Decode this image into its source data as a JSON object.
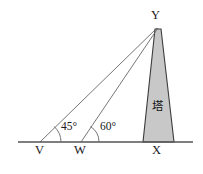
{
  "figure": {
    "type": "geometry-diagram",
    "background_color": "#ffffff",
    "line_color": "#555555",
    "tower_fill_color": "#c8c8c8",
    "tower_stroke_color": "#3c3c3c",
    "text_color": "#1a1a1a"
  },
  "labels": {
    "apex": "Y",
    "point_v": "V",
    "point_w": "W",
    "point_x": "X",
    "angle_at_v": "45°",
    "angle_at_w": "60°",
    "tower": "塔"
  },
  "geometry": {
    "baseline": {
      "x1": 18,
      "y1": 142,
      "x2": 193,
      "y2": 142
    },
    "apex": {
      "x": 158,
      "y": 28
    },
    "points": {
      "V": {
        "x": 40,
        "y": 142
      },
      "W": {
        "x": 81,
        "y": 142
      },
      "X": {
        "x": 158,
        "y": 142
      }
    },
    "tower_polygon": "155,29 161,29 174,142 143,142",
    "sight_line_v": {
      "x1": 40,
      "y1": 142,
      "x2": 157,
      "y2": 28
    },
    "sight_line_w": {
      "x1": 81,
      "y1": 142,
      "x2": 158,
      "y2": 28
    },
    "angle_arc_v": "M 61 142 A 21 21 0 0 0 54.2 126.5",
    "angle_arc_w": "M 99 142 A 18 18 0 0 0 90.5 126.6",
    "angle_values": {
      "v_degrees": 45,
      "w_degrees": 60
    }
  }
}
